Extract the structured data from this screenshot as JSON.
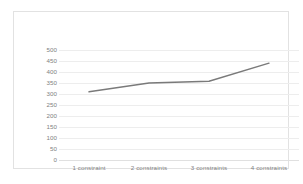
{
  "chart_data": {
    "type": "line",
    "title": "",
    "subtitle": "",
    "xlabel": "",
    "ylabel": "",
    "categories": [
      "1 constraint",
      "2 constraints",
      "3 constraints",
      "4 constraints"
    ],
    "series": [
      {
        "name": "series-1",
        "values": [
          310,
          350,
          358,
          440
        ],
        "color": "#7a7a7a"
      }
    ],
    "ylim": [
      0,
      500
    ],
    "yticks": [
      0,
      50,
      100,
      150,
      200,
      250,
      300,
      350,
      400,
      450,
      500
    ],
    "ytick_labels": [
      "0",
      "50",
      "100",
      "150",
      "200",
      "250",
      "300",
      "350",
      "400",
      "450",
      "500"
    ],
    "grid": true,
    "grid_axis": "y",
    "legend": false,
    "legend_position": "none",
    "markers": false,
    "frame_color": "#e2e2e2",
    "gridline_color": "#ededed",
    "tick_label_color": "#7f7f7f",
    "background": "#ffffff"
  }
}
